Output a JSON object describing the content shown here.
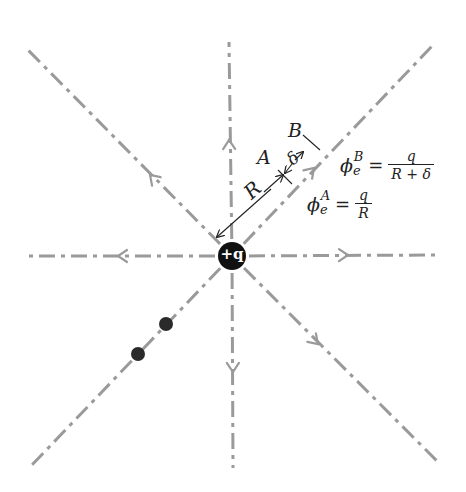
{
  "diagram": {
    "type": "electric-field-lines-point-charge",
    "charge": {
      "label": "+q",
      "center": [
        232,
        256
      ],
      "radius": 14,
      "color": "#111111"
    },
    "field_line_color": "#9a9a9a",
    "field_lines": [
      {
        "name": "up",
        "end": [
          229,
          42
        ],
        "arrow_at": [
          229,
          140
        ]
      },
      {
        "name": "down",
        "end": [
          233,
          468
        ],
        "arrow_at": [
          233,
          372
        ]
      },
      {
        "name": "left",
        "end": [
          25,
          256
        ],
        "arrow_at": [
          118,
          256
        ]
      },
      {
        "name": "right",
        "end": [
          438,
          255
        ],
        "arrow_at": [
          348,
          255
        ]
      },
      {
        "name": "upper-left",
        "end": [
          26,
          48
        ],
        "arrow_at": [
          150,
          175
        ]
      },
      {
        "name": "upper-right",
        "end": [
          434,
          44
        ],
        "arrow_at": [
          314,
          168
        ]
      },
      {
        "name": "lower-right",
        "end": [
          438,
          462
        ],
        "arrow_at": [
          318,
          344
        ]
      },
      {
        "name": "lower-left",
        "end": [
          30,
          467
        ],
        "arrow_at": null
      }
    ],
    "test_charges": [
      {
        "center": [
          166,
          324
        ],
        "radius": 7
      },
      {
        "center": [
          138,
          354
        ],
        "radius": 7
      }
    ],
    "labels": {
      "R": "R",
      "delta": "δ",
      "A": "A",
      "B": "B"
    },
    "equations": {
      "phiB": {
        "symbol": "ϕ",
        "sub": "e",
        "sup": "B",
        "equals": "=",
        "numerator": "q",
        "denominator": "R + δ"
      },
      "phiA": {
        "symbol": "ϕ",
        "sub": "e",
        "sup": "A",
        "equals": "=",
        "numerator": "q",
        "denominator": "R"
      }
    }
  }
}
